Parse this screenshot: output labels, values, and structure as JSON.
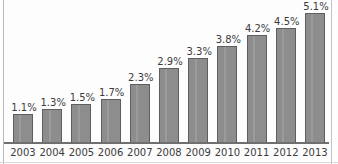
{
  "chart_data": {
    "type": "bar",
    "title": "",
    "subtitle": "",
    "xlabel": "",
    "ylabel": "",
    "categories": [
      "2003",
      "2004",
      "2005",
      "2006",
      "2007",
      "2008",
      "2009",
      "2010",
      "2011",
      "2012",
      "2013"
    ],
    "values": [
      1.1,
      1.3,
      1.5,
      1.7,
      2.3,
      2.9,
      3.3,
      3.8,
      4.2,
      4.5,
      5.1
    ],
    "value_labels": [
      "1.1%",
      "1.3%",
      "1.5%",
      "1.7%",
      "2.3%",
      "2.9%",
      "3.3%",
      "3.8%",
      "4.2%",
      "4.5%",
      "5.1%"
    ],
    "unit": "%",
    "ylim": [
      0,
      5.6
    ],
    "grid": false,
    "legend": null,
    "legend_position": "none",
    "axis_ticks_y": [],
    "colors": {
      "bar_fill": "#8d8d8d",
      "bar_border": "#5e5e5e",
      "axis_line": "#6f6f6f",
      "label_text": "#3b3b3b",
      "frame": "#b9b9b9",
      "background": "#fdfdfd"
    }
  }
}
